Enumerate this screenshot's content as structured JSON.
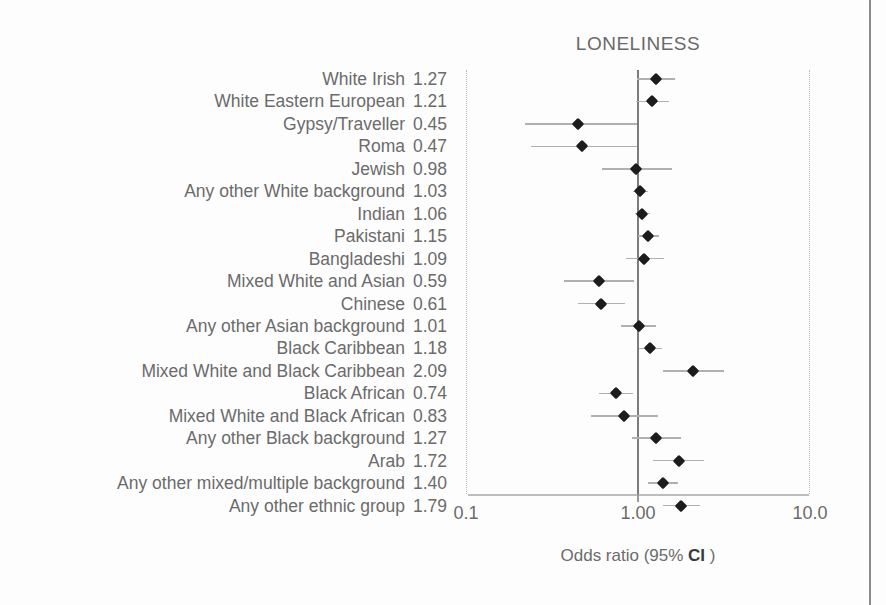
{
  "chart_data": {
    "type": "scatter",
    "subtype": "forest-plot",
    "title": "LONELINESS",
    "xlabel": "Odds ratio (95% CI )",
    "ylabel": "",
    "xscale": "log",
    "xlim": [
      0.1,
      10.0
    ],
    "xticks": [
      0.1,
      1.0,
      10.0
    ],
    "xtick_labels": [
      "0.1",
      "1.00",
      "10.0"
    ],
    "reference_line": 1.0,
    "grid": false,
    "legend": null,
    "value_column_header": "",
    "categories": [
      "White Irish",
      "White Eastern European",
      "Gypsy/Traveller",
      "Roma",
      "Jewish",
      "Any other White background",
      "Indian",
      "Pakistani",
      "Bangladeshi",
      "Mixed White and Asian",
      "Chinese",
      "Any other Asian background",
      "Black Caribbean",
      "Mixed White and Black Caribbean",
      "Black African",
      "Mixed White and Black African",
      "Any other Black background",
      "Arab",
      "Any other mixed/multiple background",
      "Any other ethnic group"
    ],
    "values": [
      1.27,
      1.21,
      0.45,
      0.47,
      0.98,
      1.03,
      1.06,
      1.15,
      1.09,
      0.59,
      0.61,
      1.01,
      1.18,
      2.09,
      0.74,
      0.83,
      1.27,
      1.72,
      1.4,
      1.79
    ],
    "value_labels": [
      "1.27",
      "1.21",
      "0.45",
      "0.47",
      "0.98",
      "1.03",
      "1.06",
      "1.15",
      "1.09",
      "0.59",
      "0.61",
      "1.01",
      "1.18",
      "2.09",
      "0.74",
      "0.83",
      "1.27",
      "1.72",
      "1.40",
      "1.79"
    ],
    "ci_low": [
      0.99,
      0.98,
      0.22,
      0.24,
      0.62,
      0.93,
      0.96,
      1.0,
      0.85,
      0.37,
      0.45,
      0.8,
      1.02,
      1.39,
      0.59,
      0.53,
      0.92,
      1.23,
      1.15,
      1.39
    ],
    "ci_high": [
      1.64,
      1.51,
      0.99,
      0.99,
      1.58,
      1.15,
      1.17,
      1.33,
      1.41,
      0.95,
      0.84,
      1.28,
      1.37,
      3.15,
      0.93,
      1.31,
      1.77,
      2.41,
      1.71,
      2.3
    ],
    "rows": [
      {
        "label": "White Irish",
        "value": "1.27",
        "or": 1.27,
        "lo": 0.99,
        "hi": 1.64
      },
      {
        "label": "White Eastern European",
        "value": "1.21",
        "or": 1.21,
        "lo": 0.98,
        "hi": 1.51
      },
      {
        "label": "Gypsy/Traveller",
        "value": "0.45",
        "or": 0.45,
        "lo": 0.22,
        "hi": 0.99
      },
      {
        "label": "Roma",
        "value": "0.47",
        "or": 0.47,
        "lo": 0.24,
        "hi": 0.99
      },
      {
        "label": "Jewish",
        "value": "0.98",
        "or": 0.98,
        "lo": 0.62,
        "hi": 1.58
      },
      {
        "label": "Any other White background",
        "value": "1.03",
        "or": 1.03,
        "lo": 0.93,
        "hi": 1.15
      },
      {
        "label": "Indian",
        "value": "1.06",
        "or": 1.06,
        "lo": 0.96,
        "hi": 1.17
      },
      {
        "label": "Pakistani",
        "value": "1.15",
        "or": 1.15,
        "lo": 1.0,
        "hi": 1.33
      },
      {
        "label": "Bangladeshi",
        "value": "1.09",
        "or": 1.09,
        "lo": 0.85,
        "hi": 1.41
      },
      {
        "label": "Mixed White and Asian",
        "value": "0.59",
        "or": 0.59,
        "lo": 0.37,
        "hi": 0.95
      },
      {
        "label": "Chinese",
        "value": "0.61",
        "or": 0.61,
        "lo": 0.45,
        "hi": 0.84
      },
      {
        "label": "Any other Asian background",
        "value": "1.01",
        "or": 1.01,
        "lo": 0.8,
        "hi": 1.28
      },
      {
        "label": "Black Caribbean",
        "value": "1.18",
        "or": 1.18,
        "lo": 1.02,
        "hi": 1.37
      },
      {
        "label": "Mixed White and Black Caribbean",
        "value": "2.09",
        "or": 2.09,
        "lo": 1.39,
        "hi": 3.15
      },
      {
        "label": "Black African",
        "value": "0.74",
        "or": 0.74,
        "lo": 0.59,
        "hi": 0.93
      },
      {
        "label": "Mixed White and Black African",
        "value": "0.83",
        "or": 0.83,
        "lo": 0.53,
        "hi": 1.31
      },
      {
        "label": "Any other Black background",
        "value": "1.27",
        "or": 1.27,
        "lo": 0.92,
        "hi": 1.77
      },
      {
        "label": "Arab",
        "value": "1.72",
        "or": 1.72,
        "lo": 1.23,
        "hi": 2.41
      },
      {
        "label": "Any other mixed/multiple background",
        "value": "1.40",
        "or": 1.4,
        "lo": 1.15,
        "hi": 1.71
      },
      {
        "label": "Any other ethnic group",
        "value": "1.79",
        "or": 1.79,
        "lo": 1.39,
        "hi": 2.3
      }
    ]
  },
  "colors": {
    "marker": "#1c1c1c",
    "whisker": "#b0b0b0",
    "reference_line": "#7c7c7c",
    "text": "#6b6b6b",
    "axis": "#bdbdbd",
    "page_edge": "#8a8a8a"
  },
  "axis": {
    "caption_prefix": "Odds ratio (95% ",
    "caption_bold": "CI",
    "caption_suffix": " )"
  }
}
